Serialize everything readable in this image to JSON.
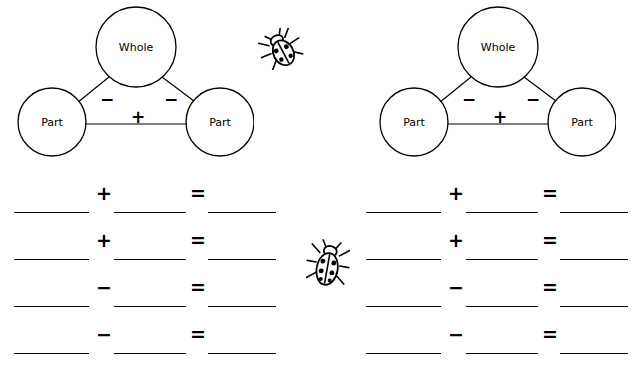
{
  "worksheet": {
    "bonds": [
      {
        "id": "left-number-bond",
        "whole_label": "Whole",
        "part_left_label": "Part",
        "part_right_label": "Part",
        "minus_left": "−",
        "minus_right": "−",
        "plus_bottom": "+"
      },
      {
        "id": "right-number-bond",
        "whole_label": "Whole",
        "part_left_label": "Part",
        "part_right_label": "Part",
        "minus_left": "−",
        "minus_right": "−",
        "plus_bottom": "+"
      }
    ],
    "left_column_equations": [
      {
        "op": "+",
        "eq": "="
      },
      {
        "op": "+",
        "eq": "="
      },
      {
        "op": "−",
        "eq": "="
      },
      {
        "op": "−",
        "eq": "="
      }
    ],
    "right_column_equations": [
      {
        "op": "+",
        "eq": "="
      },
      {
        "op": "+",
        "eq": "="
      },
      {
        "op": "−",
        "eq": "="
      },
      {
        "op": "−",
        "eq": "="
      }
    ],
    "decorations": [
      {
        "name": "beetle-icon-top",
        "kind": "beetle"
      },
      {
        "name": "beetle-icon-middle",
        "kind": "beetle"
      }
    ],
    "colors": {
      "ink": "#000000",
      "paper": "#ffffff"
    }
  }
}
